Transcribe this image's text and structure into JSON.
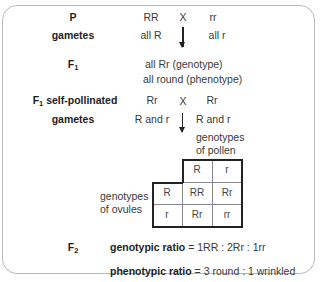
{
  "parents": {
    "label": "P",
    "left": "RR",
    "cross": "X",
    "right": "rr"
  },
  "parent_gametes": {
    "label": "gametes",
    "left": "all R",
    "right": "all r"
  },
  "f1": {
    "label": "F",
    "label_sub": "1",
    "genotype": "all Rr (genotype)",
    "phenotype": "all round (phenotype)"
  },
  "f1_cross": {
    "label": "F",
    "label_sub": "1",
    "label_rest": " self-pollinated",
    "left": "Rr",
    "cross": "X",
    "right": "Rr"
  },
  "f1_gametes": {
    "label": "gametes",
    "left": "R and r",
    "right": "R and r"
  },
  "pollen_label": [
    "genotypes",
    "of pollen"
  ],
  "ovule_label": [
    "genotypes",
    "of ovules"
  ],
  "punnett": {
    "pollen": [
      "R",
      "r"
    ],
    "ovules": [
      "R",
      "r"
    ],
    "cells": [
      [
        "RR",
        "Rr"
      ],
      [
        "Rr",
        "rr"
      ]
    ]
  },
  "f2": {
    "label": "F",
    "label_sub": "2",
    "genotypic_label": "genotypic ratio",
    "genotypic_value": " = 1RR : 2Rr : 1rr",
    "phenotypic_label": "phenotypic ratio",
    "phenotypic_value": " = 3 round : 1 wrinkled"
  }
}
